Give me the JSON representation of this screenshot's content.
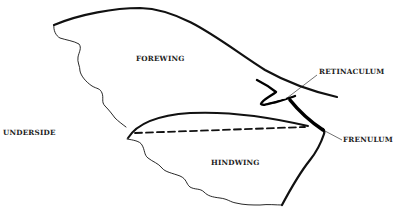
{
  "diagram": {
    "type": "anatomical-line-drawing",
    "labels": {
      "forewing": "FOREWING",
      "hindwing": "HINDWING",
      "retinaculum": "RETINACULUM",
      "frenulum": "FRENULUM",
      "underside": "UNDERSIDE"
    },
    "colors": {
      "background": "#ffffff",
      "ink": "#111111"
    }
  }
}
